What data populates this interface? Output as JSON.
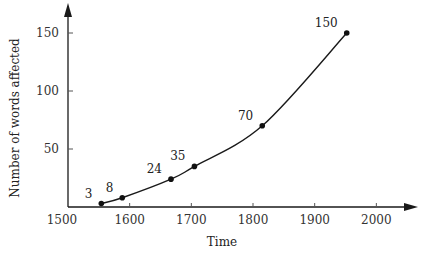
{
  "chart_data": {
    "type": "line",
    "title": "",
    "xlabel": "Time",
    "ylabel": "Number of words affected",
    "xlim": [
      1500,
      2060
    ],
    "ylim": [
      0,
      160
    ],
    "grid": false,
    "legend": null,
    "x_ticks": [
      1500,
      1600,
      1700,
      1800,
      1900,
      2000
    ],
    "y_ticks": [
      50,
      100,
      150
    ],
    "series": [
      {
        "name": "Words affected",
        "smooth": true,
        "points": [
          {
            "x": 1554,
            "y": 3,
            "label": "3"
          },
          {
            "x": 1588,
            "y": 8,
            "label": "8"
          },
          {
            "x": 1667,
            "y": 24,
            "label": "24"
          },
          {
            "x": 1705,
            "y": 35,
            "label": "35"
          },
          {
            "x": 1815,
            "y": 70,
            "label": "70"
          },
          {
            "x": 1952,
            "y": 150,
            "label": "150"
          }
        ]
      }
    ]
  },
  "colors": {
    "axis": "#1a1a1a",
    "line": "#1a1a1a",
    "text": "#333333"
  }
}
